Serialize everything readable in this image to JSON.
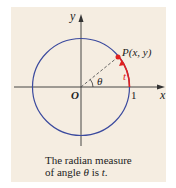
{
  "diagram": {
    "type": "unit-circle",
    "labels": {
      "y_axis": "y",
      "x_axis": "x",
      "origin": "O",
      "one": "1",
      "theta": "θ",
      "point": "P(x, y)",
      "arc": "t"
    },
    "caption": {
      "line1": "The radian measure",
      "line2_pre": "of angle ",
      "line2_theta": "θ",
      "line2_mid": " is ",
      "line2_t": "t",
      "line2_end": "."
    },
    "colors": {
      "background": "#f5ede1",
      "circle": "#3b4a9e",
      "arc": "#e02020",
      "axes": "#333333"
    }
  }
}
